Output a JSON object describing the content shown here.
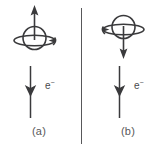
{
  "figure": {
    "background_color": "#ffffff",
    "ink_color": "#3a3a3c",
    "text_color": "#58585a",
    "divider": {
      "name": "vertical-divider",
      "color": "#58585a"
    }
  },
  "panels": [
    {
      "id": "a",
      "caption": "(a)",
      "spin": {
        "name": "spin-up",
        "arrow_direction": "up",
        "rotation_arrowhead_side": "right",
        "description": "sphere with equatorial ring, vertical arrow pointing up"
      },
      "electron": {
        "label": "e",
        "charge": "−",
        "arrow_direction": "down",
        "description": "vertical line with downward arrowhead labelled e minus"
      }
    },
    {
      "id": "b",
      "caption": "(b)",
      "spin": {
        "name": "spin-down",
        "arrow_direction": "down",
        "rotation_arrowhead_side": "left",
        "description": "sphere with equatorial ring, vertical arrow pointing down"
      },
      "electron": {
        "label": "e",
        "charge": "−",
        "arrow_direction": "down",
        "description": "vertical line with downward arrowhead labelled e minus"
      }
    }
  ]
}
